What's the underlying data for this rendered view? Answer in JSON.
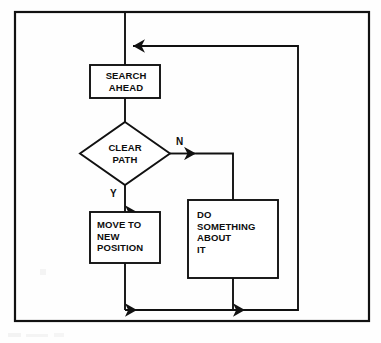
{
  "figure": {
    "type": "flowchart",
    "orientation": "top-to-bottom",
    "frame": {
      "border_color": "#111111",
      "background": "#fefefe"
    },
    "line_color": "#111111",
    "nodes": [
      {
        "id": "search_ahead",
        "shape": "process",
        "text": "SEARCH\nAHEAD",
        "align": "center"
      },
      {
        "id": "clear_path",
        "shape": "decision",
        "text": "CLEAR\nPATH",
        "align": "center"
      },
      {
        "id": "move_to_new_position",
        "shape": "process",
        "text": "MOVE TO\nNEW\nPOSITION",
        "align": "left"
      },
      {
        "id": "do_something_about_it",
        "shape": "process",
        "text": "DO\nSOMETHING\nABOUT\nIT",
        "align": "left"
      }
    ],
    "branch_labels": {
      "no": "N",
      "yes": "Y"
    },
    "edges": [
      {
        "from": "entry",
        "to": "search_ahead",
        "label": ""
      },
      {
        "from": "search_ahead",
        "to": "clear_path",
        "label": ""
      },
      {
        "from": "clear_path",
        "to": "move_to_new_position",
        "label": "Y"
      },
      {
        "from": "clear_path",
        "to": "do_something_about_it",
        "label": "N"
      },
      {
        "from": "move_to_new_position",
        "to": "loop_back",
        "label": ""
      },
      {
        "from": "do_something_about_it",
        "to": "loop_back",
        "label": ""
      },
      {
        "from": "loop_back",
        "to": "search_ahead",
        "label": ""
      }
    ]
  }
}
